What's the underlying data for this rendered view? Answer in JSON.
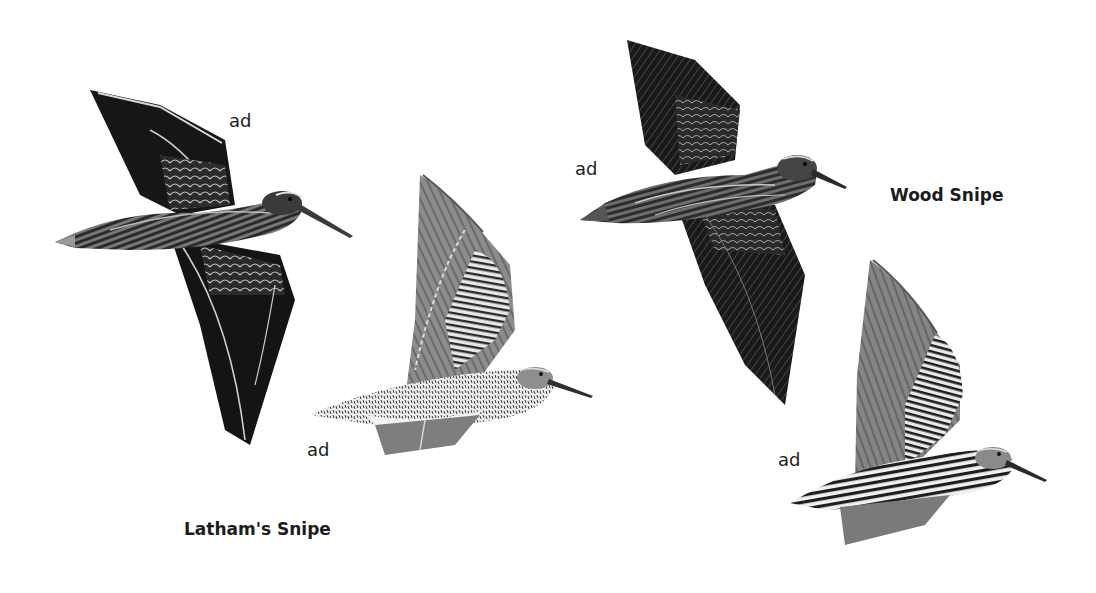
{
  "plate": {
    "background": "#ffffff",
    "species": [
      {
        "name": "Latham's Snipe",
        "figures": [
          {
            "age_label": "ad",
            "view": "upperside, flying",
            "tone": "dark"
          },
          {
            "age_label": "ad",
            "view": "underside, flying",
            "tone": "light-grey barred"
          }
        ]
      },
      {
        "name": "Wood Snipe",
        "figures": [
          {
            "age_label": "ad",
            "view": "upperside, flying",
            "tone": "dark"
          },
          {
            "age_label": "ad",
            "view": "underside, flying",
            "tone": "heavily barred"
          }
        ]
      }
    ]
  }
}
